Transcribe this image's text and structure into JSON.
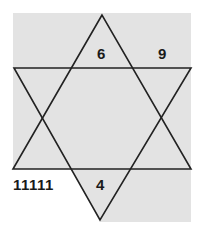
{
  "diagram": {
    "type": "number-puzzle-star",
    "shape": "six-pointed star (hexagram)",
    "colors": {
      "background": "#ffffff",
      "fill": "#e3e3e3",
      "stroke": "#222222",
      "text": "#1a1a1a"
    },
    "labels": {
      "top_inner": "6",
      "top_right": "9",
      "bottom_left": "11111",
      "bottom_inner": "4"
    }
  }
}
